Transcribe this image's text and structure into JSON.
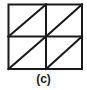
{
  "figure": {
    "label": "(c)",
    "grid": {
      "rows": 2,
      "cols": 2
    },
    "stroke_color": "#1a1a1a",
    "background": "#ffffff"
  }
}
